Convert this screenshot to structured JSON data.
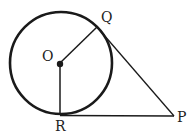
{
  "diagram": {
    "type": "geometry-tangent-circle",
    "points": {
      "O": {
        "label": "O"
      },
      "Q": {
        "label": "Q"
      },
      "R": {
        "label": "R"
      },
      "P": {
        "label": "P"
      }
    },
    "segments": [
      "OQ",
      "OR",
      "QP",
      "RP"
    ],
    "circle": {
      "center": "O"
    },
    "colors": {
      "stroke": "#1a1a1a",
      "background": "#ffffff"
    }
  }
}
